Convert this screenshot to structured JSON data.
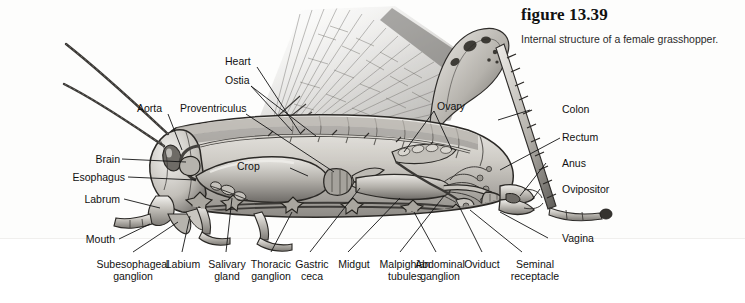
{
  "caption": {
    "figure_number": "figure 13.39",
    "title": "Internal structure of a female grasshopper."
  },
  "diagram": {
    "style": "grayscale scientific illustration",
    "colors": {
      "background": "#ffffff",
      "panel": "#fdfdfc",
      "ink": "#111111",
      "body_light": "#d9d7d2",
      "body_mid": "#9b9892",
      "body_dark": "#4a4845",
      "wing": "#b9b7b3"
    }
  },
  "labels": {
    "left": [
      {
        "text": "Brain"
      },
      {
        "text": "Esophagus"
      },
      {
        "text": "Labrum"
      },
      {
        "text": "Mouth"
      }
    ],
    "top": [
      {
        "text": "Aorta"
      },
      {
        "text": "Proventriculus"
      },
      {
        "text": "Heart"
      },
      {
        "text": "Ostia"
      },
      {
        "text": "Ovary"
      }
    ],
    "interior": [
      {
        "text": "Crop"
      }
    ],
    "right": [
      {
        "text": "Colon"
      },
      {
        "text": "Rectum"
      },
      {
        "text": "Anus"
      },
      {
        "text": "Ovipositor"
      },
      {
        "text": "Vagina"
      }
    ],
    "bottom": [
      {
        "line1": "Subesophageal",
        "line2": "ganglion"
      },
      {
        "line1": "Labium",
        "line2": ""
      },
      {
        "line1": "Salivary",
        "line2": "gland"
      },
      {
        "line1": "Thoracic",
        "line2": "ganglion"
      },
      {
        "line1": "Gastric",
        "line2": "ceca"
      },
      {
        "line1": "Midgut",
        "line2": ""
      },
      {
        "line1": "Malpighian",
        "line2": "tubules"
      },
      {
        "line1": "Abdominal",
        "line2": "ganglion"
      },
      {
        "line1": "Oviduct",
        "line2": ""
      },
      {
        "line1": "Seminal",
        "line2": "receptacle"
      }
    ]
  }
}
